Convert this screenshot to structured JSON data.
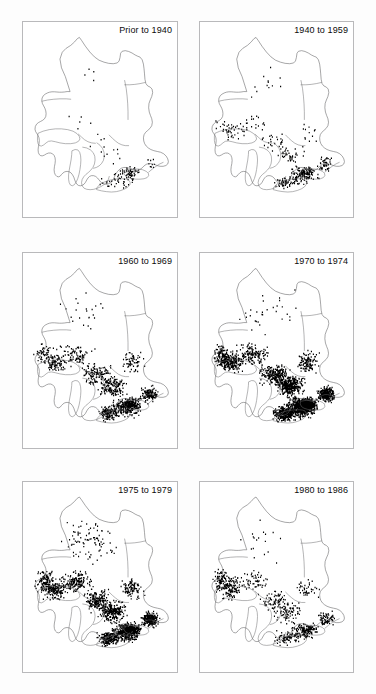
{
  "figure": {
    "type": "small-multiples-dot-density-map",
    "region": "Ontario, Canada (with Great Lakes)",
    "panel_count": 6,
    "grid": {
      "rows": 3,
      "cols": 2
    },
    "background_color": "#ffffff",
    "dot_color": "#000000",
    "outline_color": "#5d5d60",
    "border_color": "#b9b9bb"
  },
  "chart_data": {
    "type": "scatter",
    "title": "",
    "xlabel": "",
    "ylabel": "",
    "legend_position": "none",
    "grid": false,
    "panels": [
      {
        "id": "panel-prior-1940",
        "label": "Prior to 1940",
        "period_start": null,
        "period_end": 1940,
        "relative_density": 0.06,
        "dot_count": 120,
        "concentration": "extreme-southern-ontario",
        "seed": 11
      },
      {
        "id": "panel-1940-1959",
        "label": "1940 to 1959",
        "period_start": 1940,
        "period_end": 1959,
        "relative_density": 0.18,
        "dot_count": 380,
        "concentration": "southern-ontario-and-lake-superior-shore",
        "seed": 23
      },
      {
        "id": "panel-1960-1969",
        "label": "1960 to 1969",
        "period_start": 1960,
        "period_end": 1969,
        "relative_density": 0.52,
        "dot_count": 1150,
        "concentration": "southern-and-central-ontario",
        "seed": 37
      },
      {
        "id": "panel-1970-1974",
        "label": "1970 to 1974",
        "period_start": 1970,
        "period_end": 1974,
        "relative_density": 1.0,
        "dot_count": 2600,
        "concentration": "saturated-southern-ontario",
        "seed": 53
      },
      {
        "id": "panel-1975-1979",
        "label": "1975 to 1979",
        "period_start": 1975,
        "period_end": 1979,
        "relative_density": 0.74,
        "dot_count": 1750,
        "concentration": "northwestern-and-southern-ontario",
        "seed": 71
      },
      {
        "id": "panel-1980-1986",
        "label": "1980 to 1986",
        "period_start": 1980,
        "period_end": 1986,
        "relative_density": 0.34,
        "dot_count": 720,
        "concentration": "northwestern-shore-and-southern-fringe",
        "seed": 89
      }
    ]
  },
  "layout": {
    "panel_boxes": [
      {
        "left": 22,
        "top": 21,
        "width": 156,
        "height": 197
      },
      {
        "left": 199,
        "top": 21,
        "width": 155,
        "height": 197
      },
      {
        "left": 22,
        "top": 252,
        "width": 156,
        "height": 197
      },
      {
        "left": 199,
        "top": 252,
        "width": 155,
        "height": 197
      },
      {
        "left": 22,
        "top": 481,
        "width": 156,
        "height": 192
      },
      {
        "left": 199,
        "top": 481,
        "width": 155,
        "height": 192
      }
    ]
  }
}
